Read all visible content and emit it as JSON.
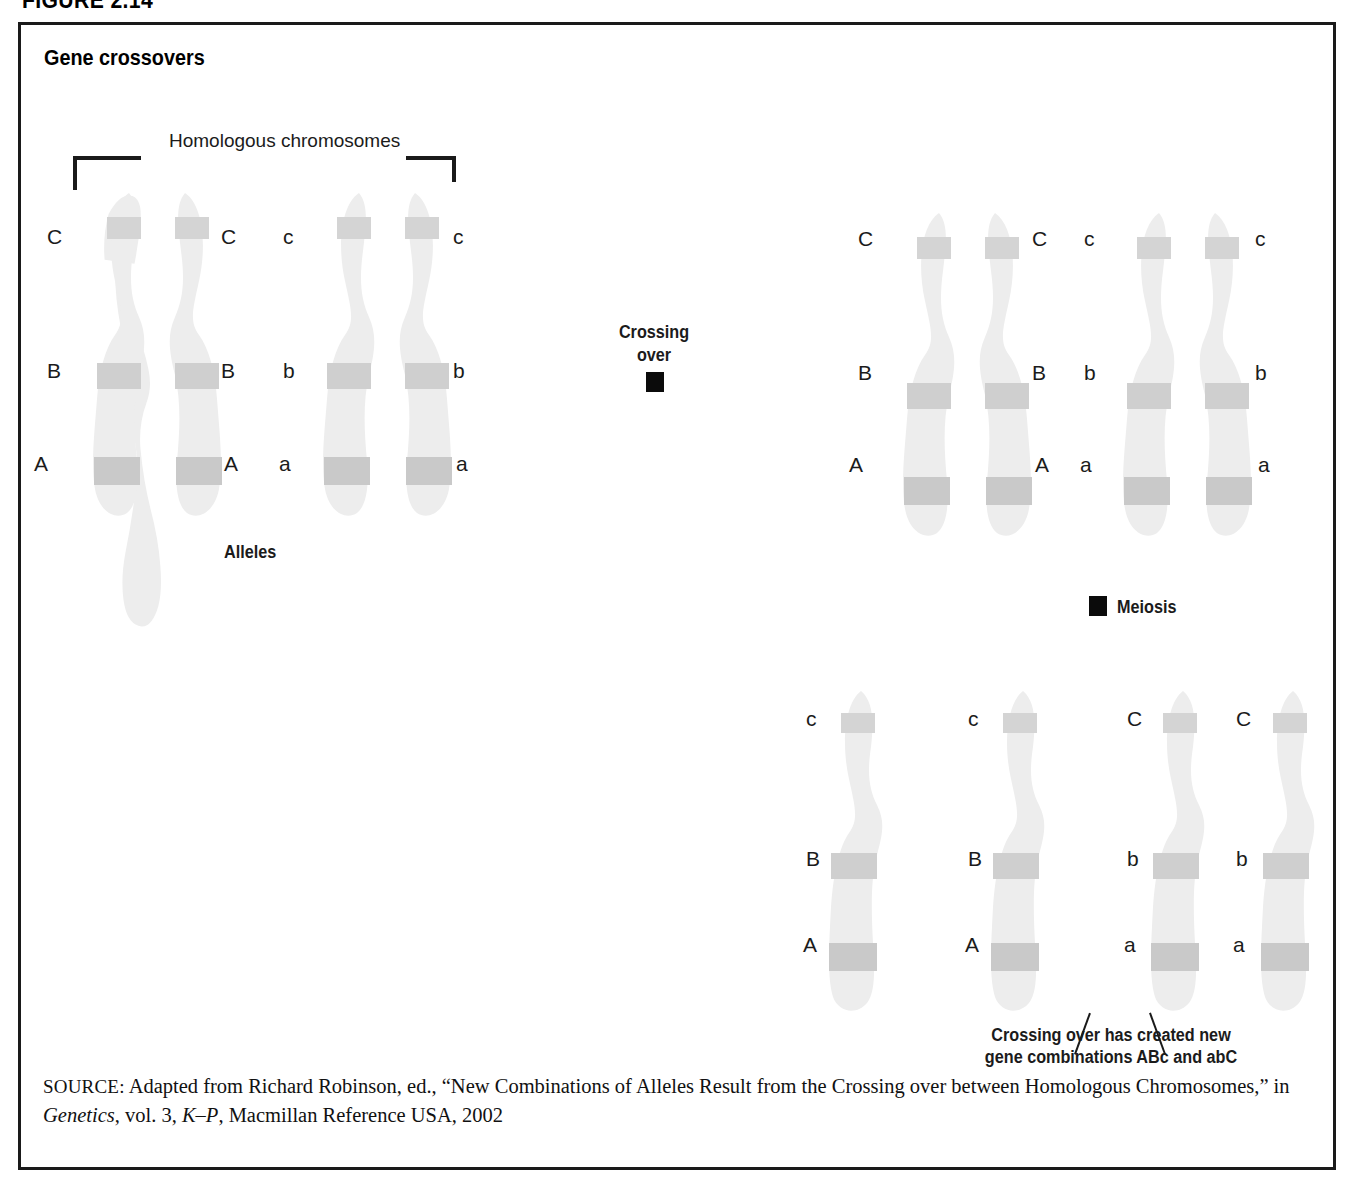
{
  "figure": {
    "number": "FIGURE 2.14",
    "title": "Gene crossovers"
  },
  "labels": {
    "homologous": "Homologous chromosomes",
    "alleles": "Alleles",
    "crossing_over_line1": "Crossing",
    "crossing_over_line2": "over",
    "meiosis": "Meiosis",
    "result_line1": "Crossing over has created new",
    "result_line2": "gene combinations ABc and abC"
  },
  "stage1": {
    "name": "Homologous chromosome pairs before crossing over",
    "pair_left": {
      "left_labels": [
        "C",
        "B",
        "A"
      ],
      "right_labels": [
        "C",
        "B",
        "A"
      ]
    },
    "pair_right": {
      "left_labels": [
        "c",
        "b",
        "a"
      ],
      "right_labels": [
        "c",
        "b",
        "a"
      ]
    }
  },
  "stage2": {
    "name": "Chromosome pairs after crossing over",
    "pair_left": {
      "left_labels": [
        "C",
        "B",
        "A"
      ],
      "right_labels": [
        "C",
        "B",
        "A"
      ]
    },
    "pair_right": {
      "left_labels": [
        "c",
        "b",
        "a"
      ],
      "right_labels": [
        "c",
        "b",
        "a"
      ]
    }
  },
  "stage3": {
    "name": "Four resulting chromatids after meiosis",
    "chromatids": [
      {
        "labels": [
          "c",
          "B",
          "A"
        ],
        "combination": "ABc"
      },
      {
        "labels": [
          "c",
          "B",
          "A"
        ],
        "combination": "ABc"
      },
      {
        "labels": [
          "C",
          "b",
          "a"
        ],
        "combination": "abC"
      },
      {
        "labels": [
          "C",
          "b",
          "a"
        ],
        "combination": "abC"
      }
    ]
  },
  "source": {
    "prefix": "SOURCE:",
    "text_part1": " Adapted from Richard Robinson, ed., “New Combinations of Alleles Result from the Crossing over between Homologous Chromosomes,” in ",
    "italic1": "Genetics",
    "text_part2": ", vol. 3, ",
    "italic2": "K–P",
    "text_part3": ", Macmillan Reference USA, 2002"
  },
  "colors": {
    "frame": "#1a1a1a",
    "text": "#1b1b1b",
    "marker": "#0b0b0b",
    "chromosome_body": "#efefef",
    "chromosome_band": "#d3d3d3",
    "background": "#ffffff"
  }
}
